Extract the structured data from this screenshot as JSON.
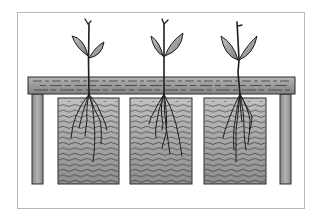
{
  "figure": {
    "description": "Three plant seedlings supported on a table with roots hanging down into three water-filled containers",
    "plant_count": 3,
    "container_count": 3
  },
  "colors": {
    "background": "#ffffff",
    "frame": "#b8b8b8",
    "outline": "#2a2a2a",
    "table_top": "#9a9a9a",
    "table_leg": "#9a9a9a",
    "water": "#a8a8a8",
    "leaf": "#a0a0a0"
  }
}
